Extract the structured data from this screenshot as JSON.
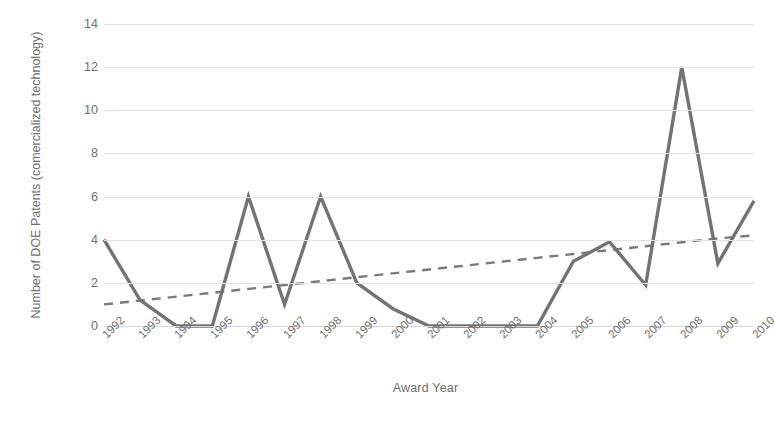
{
  "chart_data": {
    "type": "line",
    "title": "",
    "xlabel": "Award Year",
    "ylabel": "Number of DOE Patents (comercialized technology)",
    "categories": [
      "1992",
      "1993",
      "1994",
      "1995",
      "1996",
      "1997",
      "1998",
      "1999",
      "2000",
      "2001",
      "2002",
      "2003",
      "2004",
      "2005",
      "2006",
      "2007",
      "2008",
      "2009",
      "2010"
    ],
    "series": [
      {
        "name": "Number of DOE Patents (comercialized technology)",
        "style": "solid",
        "color": "#737373",
        "values": [
          4,
          1.2,
          0,
          0,
          6,
          1,
          6,
          2,
          0.8,
          0,
          0,
          0,
          0,
          3,
          3.9,
          1.9,
          12,
          2.9,
          5.8
        ]
      },
      {
        "name": "Linear trendline",
        "style": "dashed",
        "color": "#7a7a7a",
        "values": [
          1.0,
          1.18,
          1.36,
          1.54,
          1.72,
          1.9,
          2.08,
          2.26,
          2.44,
          2.62,
          2.8,
          2.98,
          3.16,
          3.34,
          3.52,
          3.7,
          3.88,
          4.06,
          4.2
        ]
      }
    ],
    "ylim": [
      0,
      14
    ],
    "yticks": [
      0,
      2,
      4,
      6,
      8,
      10,
      12,
      14
    ],
    "ytick_labels": [
      "0",
      "2",
      "4",
      "6",
      "8",
      "10",
      "12",
      "14"
    ],
    "grid": "horizontal",
    "legend": "none",
    "xlabel_rotation": -45,
    "colors": {
      "line": "#737373",
      "trendline": "#7a7a7a",
      "gridline": "#e2e2e2",
      "text": "#6f6f6f",
      "background": "#ffffff"
    }
  }
}
